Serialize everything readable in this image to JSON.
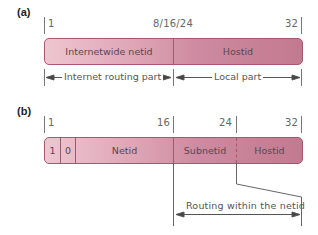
{
  "panel_a": {
    "label": "(a)",
    "ticks": {
      "start": "1",
      "middle": "8/16/24",
      "end": "32"
    },
    "fields": [
      {
        "name": "Internetwide netid"
      },
      {
        "name": "Hostid"
      }
    ],
    "spans": [
      {
        "label": "Internet routing part"
      },
      {
        "label": "Local part"
      }
    ]
  },
  "panel_b": {
    "label": "(b)",
    "ticks": {
      "start": "1",
      "t16": "16",
      "t24": "24",
      "end": "32"
    },
    "fields": [
      {
        "name": "1"
      },
      {
        "name": "0"
      },
      {
        "name": "Netid"
      },
      {
        "name": "Subnetid"
      },
      {
        "name": "Hostid"
      }
    ],
    "span": {
      "label": "Routing within the netid"
    }
  },
  "colors": {
    "bar_light": "#eec6d0",
    "bar_dark": "#c27a90",
    "bar_border": "#a55870"
  }
}
